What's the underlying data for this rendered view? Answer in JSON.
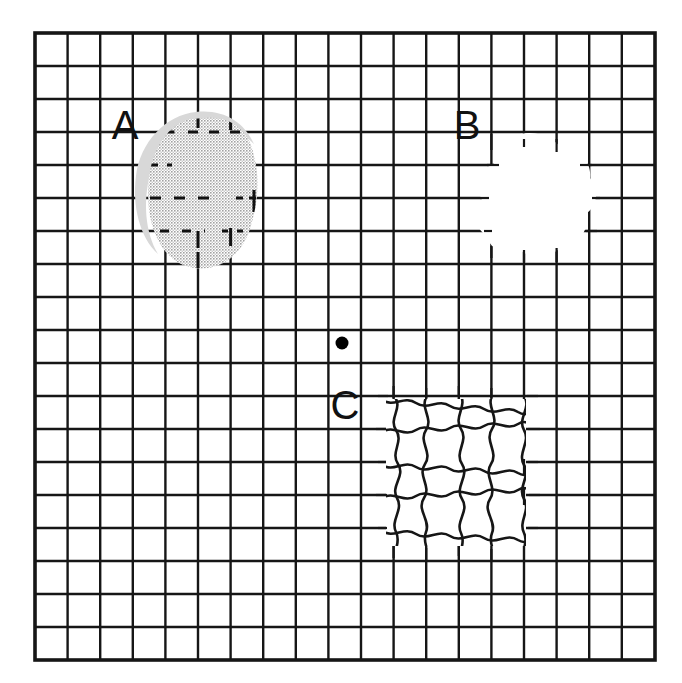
{
  "figure": {
    "name": "amsler-grid",
    "background_color": "#ffffff",
    "grid_line_color": "#161616",
    "shaded_blob_color": "#b8b8b8",
    "fixation_dot_color": "#000000"
  },
  "grid": {
    "left": 35,
    "top": 33,
    "right": 655,
    "bottom": 660,
    "columns": 19,
    "rows": 19,
    "cell_width": 32.6,
    "cell_height": 33.0,
    "inner_line_width": 2.4,
    "border_line_width": 3.4
  },
  "fixation_point": {
    "label": "fixation-dot",
    "x": 342,
    "y": 343,
    "radius": 6
  },
  "labels": [
    {
      "id": "A",
      "text": "A",
      "x": 125,
      "y": 139
    },
    {
      "id": "B",
      "text": "B",
      "x": 467,
      "y": 139
    },
    {
      "id": "C",
      "text": "C",
      "x": 345,
      "y": 419
    }
  ],
  "regions": [
    {
      "id": "A",
      "label": "A",
      "type": "shaded-scotoma",
      "fill": "#b8b8b8",
      "center_x": 203,
      "center_y": 196,
      "width": 100,
      "height": 150
    },
    {
      "id": "B",
      "label": "B",
      "type": "blank-scotoma",
      "fill": "#ffffff",
      "center_x": 537,
      "center_y": 196,
      "width": 105,
      "height": 120
    },
    {
      "id": "C",
      "label": "C",
      "type": "wavy-distortion",
      "fill": "#ffffff",
      "center_x": 455,
      "center_y": 472,
      "width": 140,
      "height": 145
    }
  ]
}
